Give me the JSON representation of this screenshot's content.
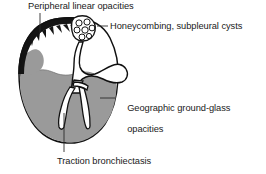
{
  "figure": {
    "colors": {
      "background": "#ffffff",
      "outline": "#111111",
      "pleural_band": "#141414",
      "ground_glass": "#9a9a9a",
      "ground_glass_shadow": "#8e8e8e",
      "airspace": "#ffffff",
      "leader_line": "#2a2a2a",
      "text": "#1a1a1a"
    },
    "regions": [
      {
        "name": "peripheral-pleural-band",
        "description": "thick black crescent along the upper-left pleural surface with jagged inner spikes"
      },
      {
        "name": "honeycomb-cyst-cluster",
        "description": "cluster of small rounded subpleural cysts at the apex"
      },
      {
        "name": "ground-glass-region",
        "description": "grey geographic opacity filling the lower lung"
      },
      {
        "name": "bronchiectasis-tubes",
        "description": "white dilated branching airways within the grey region"
      },
      {
        "name": "central-hilum",
        "description": "white bulbous hilar structure with branching vessels at the lung center"
      }
    ]
  },
  "annotations": [
    {
      "id": "peripheral",
      "text": "Peripheral linear opacities",
      "leader": "vertical line descending to the pleural band"
    },
    {
      "id": "honeycomb",
      "text": "Honeycombing, subpleural cysts",
      "leader": "short horizontal line to the cyst cluster"
    },
    {
      "id": "geographic",
      "line1": "Geographic ground-glass",
      "line2": "opacities",
      "leader": "horizontal line to the grey region edge"
    },
    {
      "id": "traction",
      "text": "Traction bronchiectasis",
      "leader": "vertical line rising to the white airway"
    }
  ]
}
